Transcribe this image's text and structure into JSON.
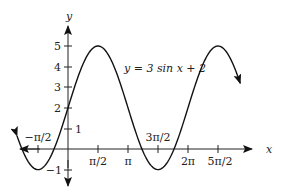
{
  "chart_data": {
    "type": "line",
    "title": "",
    "equation_label": "y = 3 sin x + 2",
    "xlabel": "x",
    "ylabel": "y",
    "x_ticks": [
      "−π/2",
      "π/2",
      "π",
      "3π/2",
      "2π",
      "5π/2"
    ],
    "y_ticks": [
      "5",
      "4",
      "3",
      "2",
      "1",
      "−1"
    ],
    "xlim": [
      -2.3,
      3.2
    ],
    "ylim": [
      -1.5,
      6.2
    ],
    "grid": false,
    "legend": "none",
    "series": [
      {
        "name": "y = 3 sin x + 2",
        "function": "3*sin(x)+2",
        "x_range_over_pi": [
          -0.85,
          2.87
        ],
        "amplitude": 3,
        "vertical_shift": 2,
        "max": 5,
        "min": -1,
        "points": [
          {
            "x": "-π/2",
            "y": -1
          },
          {
            "x": "0",
            "y": 2
          },
          {
            "x": "π/2",
            "y": 5
          },
          {
            "x": "π",
            "y": 2
          },
          {
            "x": "3π/2",
            "y": -1
          },
          {
            "x": "2π",
            "y": 2
          },
          {
            "x": "5π/2",
            "y": 5
          }
        ]
      }
    ]
  }
}
